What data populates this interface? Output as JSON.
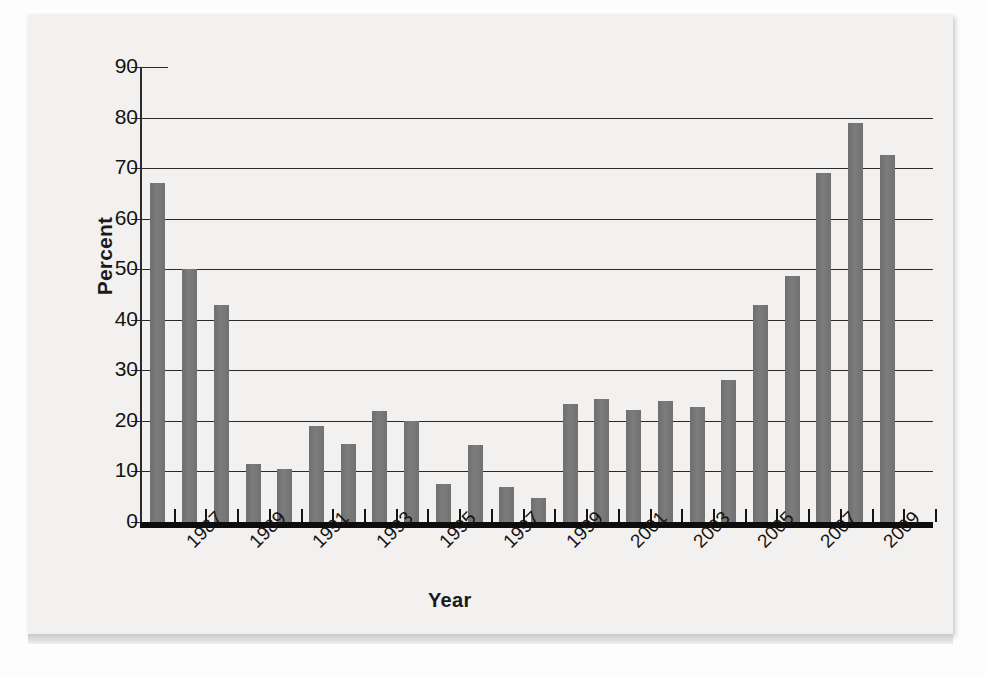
{
  "chart_data": {
    "type": "bar",
    "title": "",
    "xlabel": "Year",
    "ylabel": "Percent",
    "ylim": [
      0,
      90
    ],
    "ytick_values": [
      0,
      10,
      20,
      30,
      40,
      50,
      60,
      70,
      80,
      90
    ],
    "ytick_labels": [
      "0",
      "10",
      "20",
      "30",
      "40",
      "50",
      "60",
      "70",
      "80",
      "90"
    ],
    "xtick_labels": [
      "1987",
      "1989",
      "1991",
      "1993",
      "1995",
      "1997",
      "1999",
      "2001",
      "2003",
      "2005",
      "2007",
      "2009"
    ],
    "grid": true,
    "legend": false,
    "bar_color": "#767676",
    "axis_color": "#2b2b2b",
    "categories": [
      "1986",
      "1987",
      "1988",
      "1989",
      "1990",
      "1991",
      "1992",
      "1993",
      "1994",
      "1995",
      "1996",
      "1997",
      "1998",
      "1999",
      "2000",
      "2001",
      "2002",
      "2003",
      "2004",
      "2005",
      "2006",
      "2007",
      "2008",
      "2009",
      "2010"
    ],
    "values": [
      67,
      50,
      43,
      11.5,
      10.5,
      19,
      15.5,
      22,
      20,
      7.5,
      15.3,
      7,
      4.7,
      23.3,
      24.3,
      22.1,
      23.9,
      22.7,
      28,
      43,
      48.7,
      69,
      79,
      72.5,
      0
    ]
  },
  "axis": {
    "y_title": "Percent",
    "x_title": "Year"
  }
}
